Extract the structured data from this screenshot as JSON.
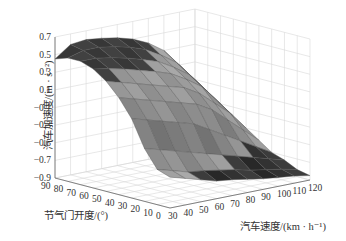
{
  "chart_data": {
    "type": "surface3d",
    "title": "",
    "xlabel": "汽车速度/(km · h⁻¹)",
    "ylabel": "节气门开度/(°)",
    "zlabel": "汽车加速度/(m · s⁻²)",
    "x_ticks": [
      "30",
      "40",
      "50",
      "60",
      "70",
      "80",
      "90",
      "100",
      "110",
      "120"
    ],
    "y_ticks": [
      "90",
      "80",
      "70",
      "60",
      "50",
      "40",
      "30",
      "20",
      "10",
      "0"
    ],
    "z_ticks": [
      "0.7",
      "0.5",
      "0.3",
      "0.1",
      "−0.1",
      "−0.3",
      "−0.5",
      "−0.7",
      "−0.9"
    ],
    "xlim": [
      30,
      120
    ],
    "ylim": [
      0,
      90
    ],
    "zlim": [
      -0.9,
      0.7
    ],
    "grid": true,
    "colormap": "gray",
    "x": [
      30,
      40,
      50,
      60,
      70,
      80,
      90,
      100,
      110,
      120
    ],
    "y": [
      0,
      10,
      20,
      30,
      40,
      50,
      60,
      70,
      80,
      90
    ],
    "z": [
      [
        -0.55,
        -0.6,
        -0.65,
        -0.7,
        -0.72,
        -0.75,
        -0.78,
        -0.8,
        -0.82,
        -0.85
      ],
      [
        -0.5,
        -0.55,
        -0.6,
        -0.62,
        -0.65,
        -0.68,
        -0.72,
        -0.75,
        -0.78,
        -0.82
      ],
      [
        -0.3,
        -0.35,
        -0.4,
        -0.45,
        -0.5,
        -0.55,
        -0.6,
        -0.65,
        -0.7,
        -0.75
      ],
      [
        0.0,
        -0.05,
        -0.1,
        -0.15,
        -0.2,
        -0.3,
        -0.4,
        -0.5,
        -0.6,
        -0.7
      ],
      [
        0.2,
        0.15,
        0.1,
        0.05,
        0.0,
        -0.05,
        -0.15,
        -0.3,
        -0.45,
        -0.6
      ],
      [
        0.35,
        0.3,
        0.25,
        0.2,
        0.15,
        0.1,
        0.0,
        -0.15,
        -0.3,
        -0.5
      ],
      [
        0.45,
        0.42,
        0.38,
        0.33,
        0.28,
        0.22,
        0.12,
        0.0,
        -0.2,
        -0.4
      ],
      [
        0.5,
        0.5,
        0.47,
        0.43,
        0.38,
        0.32,
        0.22,
        0.1,
        -0.1,
        -0.3
      ],
      [
        0.5,
        0.55,
        0.55,
        0.52,
        0.48,
        0.42,
        0.32,
        0.2,
        0.0,
        -0.2
      ],
      [
        0.45,
        0.58,
        0.6,
        0.58,
        0.55,
        0.5,
        0.42,
        0.3,
        0.1,
        -0.1
      ]
    ]
  }
}
